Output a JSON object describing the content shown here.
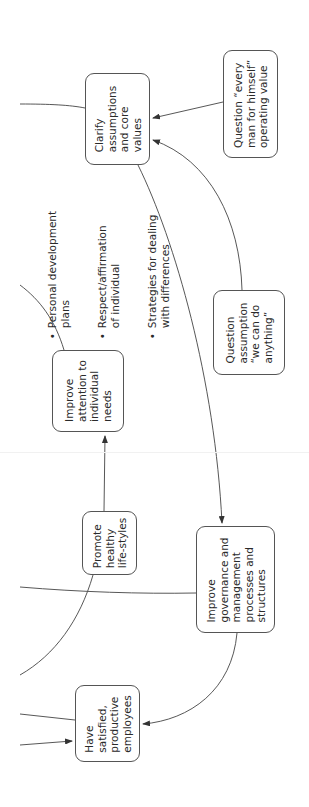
{
  "nodes": {
    "clarify": {
      "label": "Clarify\nassumptions\nand core\nvalues"
    },
    "question_every_man": {
      "label": "Question “every\nman for himself”\noperating value"
    },
    "improve_attention": {
      "label": "Improve\nattention to\nindividual\nneeds"
    },
    "improve_attention_bullets": [
      "Personal development\nplans",
      "Respect/affirmation\nof individual",
      "Strategies for dealing\nwith differences"
    ],
    "question_assumption": {
      "label": "Question\nassumption\n“we can do\nanything”"
    },
    "promote": {
      "label": "Promote\nhealthy\nlife-styles"
    },
    "improve_governance": {
      "label": "Improve\ngovernance and\nmanagement\nprocesses and\nstructures"
    },
    "satisfied": {
      "label": "Have\nsatisfied,\nproductive\nemployees"
    }
  },
  "edges": [
    {
      "from": "offpage-left",
      "to": "clarify",
      "arrow": false
    },
    {
      "from": "question_every_man",
      "to": "clarify",
      "arrow": true
    },
    {
      "from": "question_assumption",
      "to": "clarify",
      "arrow": true
    },
    {
      "from": "clarify",
      "to": "improve_governance",
      "arrow": true
    },
    {
      "from": "offpage-left",
      "to": "improve_attention",
      "arrow": false
    },
    {
      "from": "promote",
      "to": "improve_attention",
      "arrow": true
    },
    {
      "from": "promote",
      "to": "offpage-left",
      "arrow": false
    },
    {
      "from": "offpage-left",
      "to": "improve_governance",
      "arrow": false
    },
    {
      "from": "improve_governance",
      "to": "satisfied",
      "arrow": true
    },
    {
      "from": "offpage-left",
      "to": "satisfied",
      "arrow": false
    },
    {
      "from": "offpage-left",
      "to": "satisfied",
      "arrow": true
    }
  ],
  "colors": {
    "line": "#444444",
    "border": "#555555",
    "text": "#2a2a2a"
  }
}
